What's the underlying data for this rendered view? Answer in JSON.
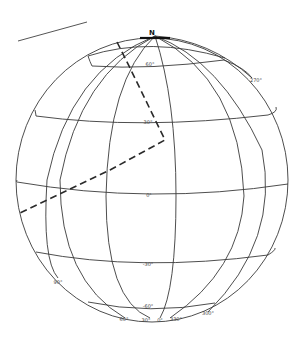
{
  "diagram": {
    "type": "globe-graticule",
    "pole_label": "N",
    "latitude_labels": [
      "60°",
      "30°",
      "0°",
      "-30°",
      "-60°"
    ],
    "longitude_labels": [
      "90°",
      "60°",
      "30°",
      "0°",
      "330°",
      "300°",
      "270°"
    ],
    "path": {
      "style": "dashed",
      "description": "Great-circle route path from near the north pole down to about 30° latitude then bending southwest across the equator"
    },
    "colors": {
      "lines": "#3a3a3a",
      "background": "#ffffff"
    }
  }
}
